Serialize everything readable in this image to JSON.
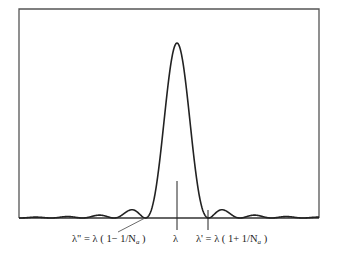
{
  "diagram": {
    "title": "",
    "curve": {
      "type": "sinc-squared",
      "description": "Diffraction/interference intensity pattern with a central main lobe at lambda and decaying side lobes",
      "main_lobe_zeros_in_lambda_units": [
        -1,
        1
      ],
      "side_lobes_each_side": 4
    },
    "labels": {
      "left": "λ\" = λ ( 1− 1/N",
      "left_sub": "a",
      "left_end": " )",
      "center": "λ",
      "right": "λ' = λ ( 1+ 1/N",
      "right_sub": "a",
      "right_end": " )"
    },
    "colors": {
      "curve": "#222222",
      "frame": "#555555",
      "baseline": "#333366"
    }
  }
}
